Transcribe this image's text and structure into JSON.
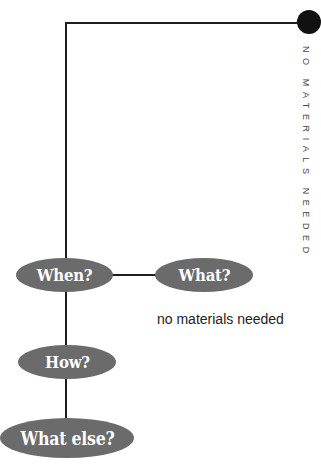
{
  "diagram": {
    "type": "flow-tree",
    "accent_dot_color": "#111111",
    "node_color": "#6b6b6b",
    "node_text_color": "#ffffff",
    "line_color": "#1e1e1e",
    "side_label": "NO MATERIALS NEEDED",
    "nodes": [
      {
        "id": "when",
        "label": "When?"
      },
      {
        "id": "what",
        "label": "What?"
      },
      {
        "id": "how",
        "label": "How?"
      },
      {
        "id": "what_else",
        "label": "What else?"
      }
    ],
    "edges": [
      {
        "from": "top-dot",
        "to": "when"
      },
      {
        "from": "when",
        "to": "what"
      },
      {
        "from": "when",
        "to": "how"
      },
      {
        "from": "how",
        "to": "what_else"
      }
    ],
    "annotations": {
      "what_caption": "no materials needed"
    }
  }
}
